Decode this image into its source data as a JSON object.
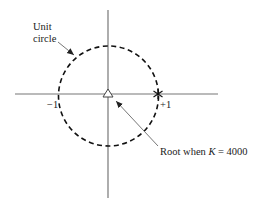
{
  "diagram": {
    "type": "z-plane unit circle",
    "labels": {
      "unit_circle_line1": "Unit",
      "unit_circle_line2": "circle",
      "minus_one": "−1",
      "plus_one": "+1",
      "root_annotation": "Root when K = 4000",
      "root_prefix": "Root when ",
      "root_var": "K",
      "root_suffix": " = 4000"
    },
    "markers": {
      "origin": "triangle",
      "plus_one_point": "asterisk"
    },
    "colors": {
      "axis": "#777777",
      "circle": "#111111",
      "arrow": "#777777",
      "text": "#222222"
    }
  }
}
